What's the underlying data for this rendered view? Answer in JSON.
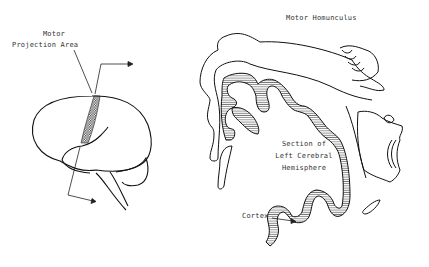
{
  "diagram": {
    "type": "anatomical-illustration",
    "labels": {
      "motor_line1": "Motor",
      "motor_line2": "Projection Area",
      "homunculus_title": "Motor Homunculus",
      "section_line1": "Section of",
      "section_line2": "Left Cerebral",
      "section_line3": "Hemisphere",
      "cortex": "Cortex"
    },
    "parts": [
      "brain-lateral-view",
      "motor-projection-strip",
      "coronal-section",
      "cortex-hatching",
      "homunculus-figure",
      "arrows"
    ],
    "colors": {
      "stroke": "#111111",
      "label": "#333333",
      "background": "#ffffff"
    }
  }
}
